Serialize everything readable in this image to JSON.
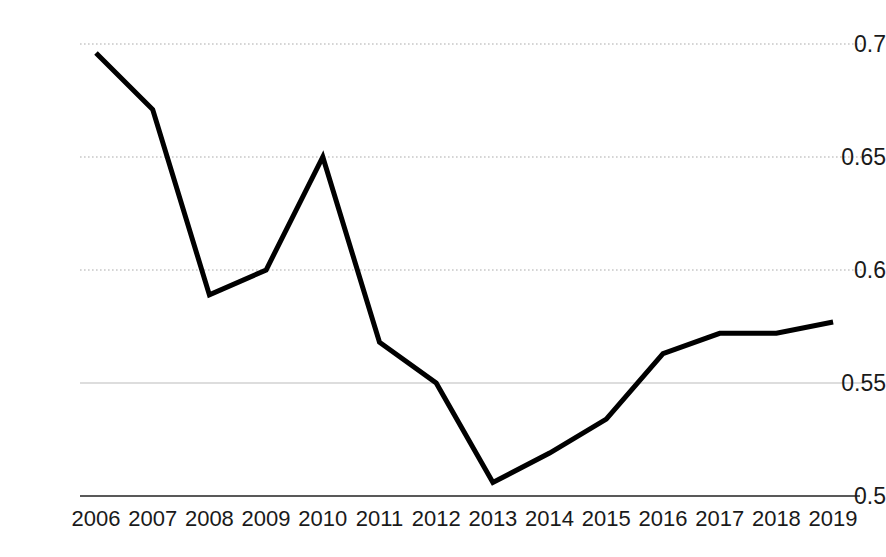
{
  "chart_data": {
    "type": "line",
    "title": "",
    "subtitle": "",
    "xlabel": "",
    "ylabel": "",
    "categories": [
      "2006",
      "2007",
      "2008",
      "2009",
      "2010",
      "2011",
      "2012",
      "2013",
      "2014",
      "2015",
      "2016",
      "2017",
      "2018",
      "2019"
    ],
    "values": [
      0.696,
      0.671,
      0.589,
      0.6,
      0.65,
      0.568,
      0.55,
      0.506,
      0.519,
      0.534,
      0.563,
      0.572,
      0.572,
      0.577
    ],
    "series": [
      {
        "name": "",
        "values": [
          0.696,
          0.671,
          0.589,
          0.6,
          0.65,
          0.568,
          0.55,
          0.506,
          0.519,
          0.534,
          0.563,
          0.572,
          0.572,
          0.577
        ]
      }
    ],
    "ylim": [
      0.5,
      0.7
    ],
    "xlim": [
      "2006",
      "2019"
    ],
    "y_ticks": [
      0.7,
      0.65,
      0.6,
      0.55,
      0.5
    ],
    "y_tick_labels": [
      "0.7",
      "0.65",
      "0.6",
      "0.55",
      "0.5"
    ],
    "x_tick_labels": [
      "2006",
      "2007",
      "2008",
      "2009",
      "2010",
      "2011",
      "2012",
      "2013",
      "2014",
      "2015",
      "2016",
      "2017",
      "2018",
      "2019"
    ],
    "grid": true,
    "grid_style": "dotted",
    "legend": false,
    "legend_position": "none",
    "annotations": [],
    "colors": {
      "line": "#000000",
      "gridline": "#c8c8c8",
      "axis": "#595959",
      "tick_text": "#1a1a1a",
      "background": "#ffffff"
    },
    "line_width": 5
  }
}
